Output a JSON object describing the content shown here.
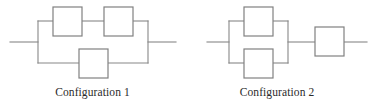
{
  "figure": {
    "line_color": "#888888",
    "box_stroke_color": "#808080",
    "box_fill_color": "#ffffff",
    "background_color": "#ffffff",
    "caption_color": "#2b2b2b"
  },
  "configurations": [
    {
      "id": "configuration-1",
      "caption": "Configuration 1",
      "topology": "parallel",
      "branches": [
        {
          "id": "top-branch",
          "arrangement": "series",
          "component_count": 2
        },
        {
          "id": "bottom-branch",
          "arrangement": "series",
          "component_count": 1
        }
      ],
      "component_count": 3,
      "components": [
        {
          "id": "c1-top-left",
          "label": ""
        },
        {
          "id": "c1-top-right",
          "label": ""
        },
        {
          "id": "c1-bottom",
          "label": ""
        }
      ],
      "terminals": {
        "input": "left",
        "output": "right"
      }
    },
    {
      "id": "configuration-2",
      "caption": "Configuration 2",
      "topology": "parallel-then-series",
      "branches": [
        {
          "id": "top-branch",
          "arrangement": "series",
          "component_count": 1
        },
        {
          "id": "bottom-branch",
          "arrangement": "series",
          "component_count": 1
        },
        {
          "id": "series-tail",
          "arrangement": "series",
          "component_count": 1
        }
      ],
      "component_count": 3,
      "components": [
        {
          "id": "c2-top",
          "label": ""
        },
        {
          "id": "c2-bottom",
          "label": ""
        },
        {
          "id": "c2-series",
          "label": ""
        }
      ],
      "terminals": {
        "input": "left",
        "output": "right"
      }
    }
  ]
}
